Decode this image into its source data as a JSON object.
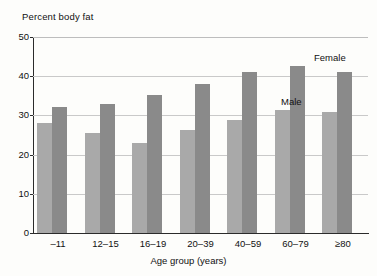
{
  "chart_data": {
    "type": "bar",
    "title": "Percent body fat",
    "xlabel": "Age group (years)",
    "ylabel": "",
    "ylim": [
      0,
      50
    ],
    "yticks": [
      "0",
      "10",
      "20",
      "30",
      "40",
      "50"
    ],
    "grid": true,
    "legend_position": "inline-annotation",
    "categories": [
      "–11",
      "12–15",
      "16–19",
      "20–39",
      "40–59",
      "60–79",
      "≥80"
    ],
    "series": [
      {
        "name": "Male",
        "color": "#a9a9a9",
        "values": [
          28.0,
          25.5,
          23.0,
          26.2,
          28.8,
          31.3,
          30.9
        ]
      },
      {
        "name": "Female",
        "color": "#8a8a8a",
        "values": [
          32.2,
          33.0,
          35.2,
          38.0,
          41.0,
          42.5,
          41.0
        ]
      }
    ],
    "annotations": [
      {
        "text": "Female",
        "series": "Female"
      },
      {
        "text": "Male",
        "series": "Male"
      }
    ]
  }
}
